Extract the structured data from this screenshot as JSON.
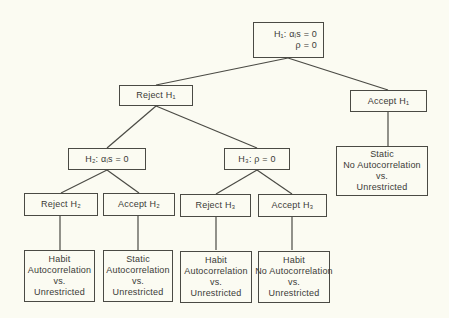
{
  "diagram": {
    "root": {
      "line1": "H₁: αᵢs = 0",
      "line2": "ρ = 0"
    },
    "level1": {
      "reject": "Reject H₁",
      "accept": "Accept H₁",
      "accept_result": [
        "Static",
        "No Autocorrelation",
        "vs.",
        "Unrestricted"
      ]
    },
    "level2": {
      "h2": "H₂: αᵢs = 0",
      "h3": "H₃: ρ = 0",
      "reject_h2": "Reject H₂",
      "accept_h2": "Accept H₂",
      "reject_h3": "Reject H₃",
      "accept_h3": "Accept H₃"
    },
    "leaves": [
      [
        "Habit",
        "Autocorrelation",
        "vs.",
        "Unrestricted"
      ],
      [
        "Static",
        "Autocorrelation",
        "vs.",
        "Unrestricted"
      ],
      [
        "Habit",
        "Autocorrelation",
        "vs.",
        "Unrestricted"
      ],
      [
        "Habit",
        "No Autocorrelation",
        "vs.",
        "Unrestricted"
      ]
    ],
    "colors": {
      "line": "#4a4a44",
      "background": "#fbfbf2",
      "text": "#3a3a36"
    }
  }
}
